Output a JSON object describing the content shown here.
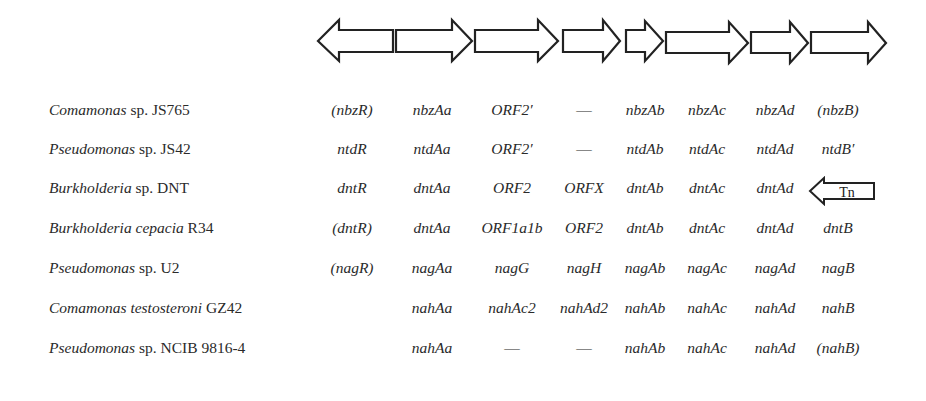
{
  "diagram": {
    "type": "gene-cluster-comparison",
    "arrows": [
      {
        "id": "a1",
        "direction": "left",
        "x1": 318,
        "x2": 393
      },
      {
        "id": "a2",
        "direction": "right",
        "x1": 396,
        "x2": 472
      },
      {
        "id": "a3",
        "direction": "right",
        "x1": 475,
        "x2": 558
      },
      {
        "id": "a4",
        "direction": "right",
        "x1": 563,
        "x2": 620
      },
      {
        "id": "a5",
        "direction": "right",
        "x1": 626,
        "x2": 663
      },
      {
        "id": "a6",
        "direction": "right",
        "x1": 666,
        "x2": 748
      },
      {
        "id": "a7",
        "direction": "right",
        "x1": 751,
        "x2": 808
      },
      {
        "id": "a8",
        "direction": "right",
        "x1": 811,
        "x2": 886
      }
    ],
    "column_centers": [
      352,
      432,
      512,
      584,
      645,
      707,
      775,
      838
    ],
    "rows": [
      {
        "genus": "Comamonas",
        "rest": " sp. JS765",
        "genes": [
          "(nbzR)",
          "nbzAa",
          "ORF2′",
          "—",
          "nbzAb",
          "nbzAc",
          "nbzAd",
          "(nbzB)"
        ]
      },
      {
        "genus": "Pseudomonas",
        "rest": " sp. JS42",
        "genes": [
          "ntdR",
          "ntdAa",
          "ORF2′",
          "—",
          "ntdAb",
          "ntdAc",
          "ntdAd",
          "ntdB′"
        ]
      },
      {
        "genus": "Burkholderia",
        "rest": " sp. DNT",
        "genes": [
          "dntR",
          "dntAa",
          "ORF2",
          "ORFX",
          "dntAb",
          "dntAc",
          "dntAd",
          ""
        ]
      },
      {
        "genus": "Burkholderia cepacia",
        "rest": " R34",
        "genes": [
          "(dntR)",
          "dntAa",
          "ORF1a1b",
          "ORF2",
          "dntAb",
          "dntAc",
          "dntAd",
          "dntB"
        ]
      },
      {
        "genus": "Pseudomonas",
        "rest": " sp. U2",
        "genes": [
          "(nagR)",
          "nagAa",
          "nagG",
          "nagH",
          "nagAb",
          "nagAc",
          "nagAd",
          "nagB"
        ]
      },
      {
        "genus": "Comamonas testosteroni",
        "rest": " GZ42",
        "genes": [
          "",
          "nahAa",
          "nahAc2",
          "nahAd2",
          "nahAb",
          "nahAc",
          "nahAd",
          "nahB"
        ]
      },
      {
        "genus": "Pseudomonas",
        "rest": " sp. NCIB 9816-4",
        "genes": [
          "",
          "nahAa",
          "—",
          "—",
          "nahAb",
          "nahAc",
          "nahAd",
          "(nahB)"
        ]
      }
    ],
    "transposon": {
      "label": "Tn",
      "row": 2,
      "direction": "left"
    }
  }
}
